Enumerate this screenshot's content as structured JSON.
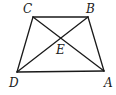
{
  "figure": {
    "type": "trapezoid-with-diagonals",
    "width": 116,
    "height": 95,
    "stroke_color": "#1a1a1a",
    "background": "#ffffff"
  },
  "vertices": {
    "A": {
      "label": "A",
      "x": 104,
      "y": 71,
      "label_x": 104,
      "label_y": 87
    },
    "B": {
      "label": "B",
      "x": 88,
      "y": 17,
      "label_x": 86,
      "label_y": 13
    },
    "C": {
      "label": "C",
      "x": 33,
      "y": 17,
      "label_x": 23,
      "label_y": 13
    },
    "D": {
      "label": "D",
      "x": 17,
      "y": 72,
      "label_x": 9,
      "label_y": 87
    },
    "E": {
      "label": "E",
      "x": 60,
      "y": 39,
      "label_x": 56,
      "label_y": 54
    }
  },
  "segments": [
    {
      "name": "CB",
      "from": "C",
      "to": "B"
    },
    {
      "name": "BA",
      "from": "B",
      "to": "A"
    },
    {
      "name": "AD",
      "from": "A",
      "to": "D"
    },
    {
      "name": "DC",
      "from": "D",
      "to": "C"
    },
    {
      "name": "CA",
      "from": "C",
      "to": "A"
    },
    {
      "name": "BD",
      "from": "B",
      "to": "D"
    }
  ]
}
